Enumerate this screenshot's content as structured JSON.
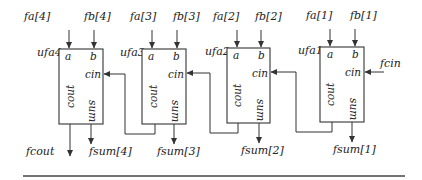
{
  "diagram": {
    "type": "ripple-carry-adder",
    "stroke_color": "#333333",
    "background": "#ffffff",
    "units": [
      {
        "instance": "ufa4",
        "inputs": {
          "a": "fa[4]",
          "b": "fb[4]"
        },
        "ports": {
          "a": "a",
          "b": "b",
          "cin": "cin",
          "cout": "cout",
          "sum": "sum"
        },
        "sum_out": "fsum[4]",
        "cout_out": "fcout"
      },
      {
        "instance": "ufa3",
        "inputs": {
          "a": "fa[3]",
          "b": "fb[3]"
        },
        "ports": {
          "a": "a",
          "b": "b",
          "cin": "cin",
          "cout": "cout",
          "sum": "sum"
        },
        "sum_out": "fsum[3]"
      },
      {
        "instance": "ufa2",
        "inputs": {
          "a": "fa[2]",
          "b": "fb[2]"
        },
        "ports": {
          "a": "a",
          "b": "b",
          "cin": "cin",
          "cout": "cout",
          "sum": "sum"
        },
        "sum_out": "fsum[2]"
      },
      {
        "instance": "ufa1",
        "inputs": {
          "a": "fa[1]",
          "b": "fb[1]"
        },
        "ports": {
          "a": "a",
          "b": "b",
          "cin": "cin",
          "cout": "cout",
          "sum": "sum"
        },
        "sum_out": "fsum[1]",
        "cin_in": "fcin"
      }
    ],
    "connections": [
      {
        "from": "ufa1.cout",
        "to": "ufa2.cin"
      },
      {
        "from": "ufa2.cout",
        "to": "ufa3.cin"
      },
      {
        "from": "ufa3.cout",
        "to": "ufa4.cin"
      }
    ]
  }
}
